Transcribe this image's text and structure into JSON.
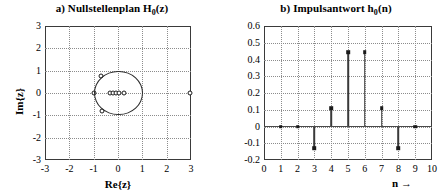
{
  "figure": {
    "panels": [
      {
        "id": "a",
        "title_prefix": "a) Nullstellenplan  H",
        "title_sub": "0",
        "title_suffix": "(z)",
        "xlabel": "Re{z}",
        "ylabel": "Im{z}"
      },
      {
        "id": "b",
        "title_prefix": "b) Impulsantwort h",
        "title_sub": "0",
        "title_suffix": "(n)",
        "xlabel": "n  →",
        "ylabel": ""
      }
    ]
  },
  "chart_data": [
    {
      "type": "scatter",
      "title": "a) Nullstellenplan H0(z)",
      "xlabel": "Re{z}",
      "ylabel": "Im{z}",
      "xlim": [
        -3,
        3
      ],
      "ylim": [
        -3,
        3
      ],
      "xticks": [
        -3,
        -2,
        -1,
        0,
        1,
        2,
        3
      ],
      "yticks": [
        -3,
        -2,
        -1,
        0,
        1,
        2,
        3
      ],
      "xtick_labels": [
        "-3",
        "-2",
        "-1",
        "0",
        "1",
        "2",
        "3"
      ],
      "ytick_labels": [
        "-3",
        "-2",
        "-1",
        "0",
        "1",
        "2",
        "3"
      ],
      "grid": true,
      "legend": "none",
      "annotations": [
        "unit circle |z| = 1 drawn"
      ],
      "unit_circle": {
        "center": [
          0,
          0
        ],
        "radius": 1
      },
      "series": [
        {
          "name": "zeros",
          "marker": "o",
          "points": [
            [
              -1.0,
              0.0
            ],
            [
              -0.68,
              0.77
            ],
            [
              -0.65,
              -0.8
            ],
            [
              -0.32,
              0.0
            ],
            [
              -0.2,
              0.0
            ],
            [
              -0.08,
              0.0
            ],
            [
              0.04,
              0.0
            ],
            [
              0.24,
              0.0
            ],
            [
              2.95,
              0.0
            ]
          ]
        }
      ]
    },
    {
      "type": "bar",
      "subtype": "stem",
      "title": "b) Impulsantwort h0(n)",
      "xlabel": "n →",
      "ylabel": "",
      "xlim": [
        0,
        10
      ],
      "ylim": [
        -0.2,
        0.6
      ],
      "xticks": [
        0,
        1,
        2,
        3,
        4,
        5,
        6,
        7,
        8,
        9,
        10
      ],
      "yticks": [
        -0.2,
        -0.1,
        0,
        0.1,
        0.2,
        0.3,
        0.4,
        0.5,
        0.6
      ],
      "xtick_labels": [
        "0",
        "1",
        "2",
        "3",
        "4",
        "5",
        "6",
        "7",
        "8",
        "9",
        "10"
      ],
      "ytick_labels": [
        "-0.2",
        "-0.1",
        "0",
        "0.1",
        "0.2",
        "0.3",
        "0.4",
        "0.5",
        "0.6"
      ],
      "grid": true,
      "legend": "none",
      "categories": [
        1,
        2,
        3,
        4,
        5,
        6,
        7,
        8,
        9
      ],
      "values": [
        0.0,
        0.0,
        -0.13,
        0.11,
        0.445,
        0.445,
        0.11,
        -0.13,
        0.0
      ]
    }
  ]
}
